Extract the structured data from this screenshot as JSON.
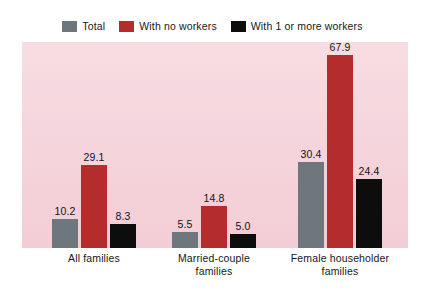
{
  "legend": {
    "items": [
      {
        "label": "Total",
        "color": "#6e767e",
        "icon": "legend-swatch-icon"
      },
      {
        "label": "With no workers",
        "color": "#b52c2c",
        "icon": "legend-swatch-icon"
      },
      {
        "label": "With 1 or more workers",
        "color": "#0d0d0d",
        "icon": "legend-swatch-icon"
      }
    ]
  },
  "chart_data": {
    "type": "bar",
    "title": "",
    "xlabel": "",
    "ylabel": "",
    "ylim": [
      0,
      72
    ],
    "grid": false,
    "legend_position": "top-center",
    "categories": [
      "All families",
      "Married-couple families",
      "Female householder families"
    ],
    "category_lines": [
      [
        "All families"
      ],
      [
        "Married-couple",
        "families"
      ],
      [
        "Female householder",
        "families"
      ]
    ],
    "series": [
      {
        "name": "Total",
        "color": "#6e767e",
        "values": [
          10.2,
          5.5,
          30.4
        ]
      },
      {
        "name": "With no workers",
        "color": "#b52c2c",
        "values": [
          29.1,
          14.8,
          67.9
        ]
      },
      {
        "name": "With 1 or more workers",
        "color": "#0d0d0d",
        "values": [
          8.3,
          5.0,
          24.4
        ]
      }
    ],
    "value_labels": [
      [
        "10.2",
        "29.1",
        "8.3"
      ],
      [
        "5.5",
        "14.8",
        "5.0"
      ],
      [
        "30.4",
        "67.9",
        "24.4"
      ]
    ],
    "plot_background": "#f5d5dc"
  }
}
